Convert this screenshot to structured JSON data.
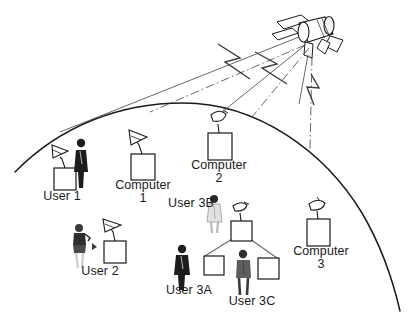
{
  "diagram": {
    "type": "satellite-communication-network",
    "palette": {
      "line": "#1a1a1a",
      "beam": "#5a5a5a",
      "person_dark": "#1c1c1c",
      "person_mid": "#5d5d5d",
      "person_light": "#d8d8d8",
      "background": "#ffffff",
      "box_fill": "#ffffff"
    },
    "earth": {
      "name": "earth-horizon-arc",
      "description": "curved arc representing the earth surface"
    },
    "satellite": {
      "name": "satellite",
      "parts": [
        "cylindrical-body",
        "solar-panel-left",
        "solar-panel-right",
        "antenna-feed-horn",
        "downlink-boom"
      ]
    },
    "beams": [
      {
        "name": "beam-left",
        "target": "User 1 / Computer 1 region"
      },
      {
        "name": "beam-center",
        "target": "Computer 2"
      },
      {
        "name": "beam-right",
        "target": "Computer 3"
      }
    ],
    "labels": [
      {
        "id": "user-1",
        "lines": [
          "User 1"
        ],
        "x": 62,
        "y": 196
      },
      {
        "id": "computer-1",
        "lines": [
          "Computer",
          "1"
        ],
        "x": 143,
        "y": 185
      },
      {
        "id": "computer-2",
        "lines": [
          "Computer",
          "2"
        ],
        "x": 219,
        "y": 165
      },
      {
        "id": "user-3b",
        "lines": [
          "User 3B"
        ],
        "x": 191,
        "y": 203
      },
      {
        "id": "user-2",
        "lines": [
          "User 2"
        ],
        "x": 100,
        "y": 271
      },
      {
        "id": "user-3a",
        "lines": [
          "User 3A"
        ],
        "x": 189,
        "y": 290
      },
      {
        "id": "user-3c",
        "lines": [
          "User 3C"
        ],
        "x": 252,
        "y": 301
      },
      {
        "id": "computer-3",
        "lines": [
          "Computer",
          "3"
        ],
        "x": 321,
        "y": 251
      }
    ],
    "nodes": [
      {
        "id": "user-1-terminal",
        "kind": "antenna-terminal",
        "has_dish": true
      },
      {
        "id": "user-1-person",
        "kind": "person",
        "tone": "dark"
      },
      {
        "id": "computer-1",
        "kind": "antenna-terminal",
        "has_dish": true
      },
      {
        "id": "computer-2",
        "kind": "antenna-terminal",
        "has_dish": true
      },
      {
        "id": "user-2-person",
        "kind": "person",
        "tone": "light"
      },
      {
        "id": "user-2-terminal",
        "kind": "antenna-terminal",
        "has_dish": true
      },
      {
        "id": "user-3-hub",
        "kind": "antenna-terminal",
        "has_dish": true
      },
      {
        "id": "user-3a-person",
        "kind": "person",
        "tone": "dark"
      },
      {
        "id": "user-3a-computer",
        "kind": "computer-box",
        "has_dish": false
      },
      {
        "id": "user-3b-person",
        "kind": "person",
        "tone": "light"
      },
      {
        "id": "user-3c-person",
        "kind": "person",
        "tone": "mid"
      },
      {
        "id": "user-3c-computer",
        "kind": "computer-box",
        "has_dish": false
      },
      {
        "id": "computer-3",
        "kind": "antenna-terminal",
        "has_dish": true
      }
    ],
    "lan_links": [
      {
        "from": "user-3-hub",
        "to": "user-3a-computer"
      },
      {
        "from": "user-3-hub",
        "to": "user-3c-computer"
      }
    ]
  }
}
